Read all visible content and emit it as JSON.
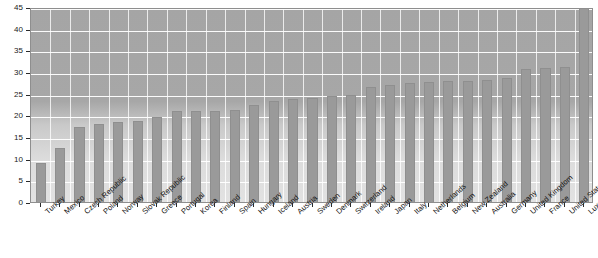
{
  "chart_data": {
    "type": "bar",
    "title": "",
    "xlabel": "",
    "ylabel": "",
    "ylim": [
      0,
      45
    ],
    "yticks": [
      0,
      5,
      10,
      15,
      20,
      25,
      30,
      35,
      40,
      45
    ],
    "grid": true,
    "legend": "none",
    "categories": [
      "Turkey",
      "Mexico",
      "Czech Republic",
      "Poland",
      "Norway",
      "Slovak Republic",
      "Greece",
      "Portugal",
      "Korea",
      "Finland",
      "Spain",
      "Hungary",
      "Iceland",
      "Austria",
      "Sweden",
      "Denmark",
      "Switzerland",
      "Ireland",
      "Japan",
      "Italy",
      "Netherlands",
      "Belgium",
      "New Zealand",
      "Australia",
      "Germany",
      "United Kingdom",
      "France",
      "United States",
      "Luxembourg"
    ],
    "values": [
      9.0,
      12.5,
      17.2,
      18.0,
      18.4,
      18.8,
      19.6,
      21.0,
      21.0,
      21.1,
      21.2,
      22.5,
      23.4,
      23.8,
      24.0,
      24.4,
      24.8,
      26.5,
      27.0,
      27.4,
      27.8,
      28.0,
      28.0,
      28.1,
      28.6,
      30.8,
      31.0,
      31.2,
      45.0
    ],
    "bar_color": "#9a9a9a",
    "plot_background": "#a7a7a7",
    "gridline_color": "#ffffff"
  },
  "axis": {
    "y_tick_labels": [
      "0",
      "5",
      "10",
      "15",
      "20",
      "25",
      "30",
      "35",
      "40",
      "45"
    ]
  }
}
